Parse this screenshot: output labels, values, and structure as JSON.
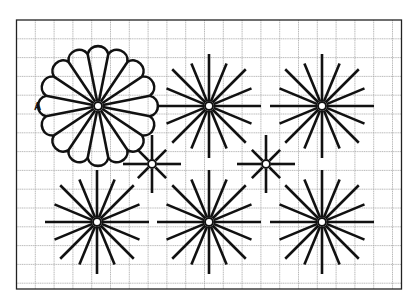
{
  "diagram": {
    "colors": {
      "background": "#ffffff",
      "grid": "#a8a8a8",
      "frame": "#222222",
      "ink": "#111111"
    },
    "frame": {
      "x": 16.5,
      "y": 20,
      "width": 385,
      "height": 269
    },
    "grid": {
      "spacing": 18.8
    },
    "label_a": {
      "text": "A",
      "x": 34,
      "y": 101
    },
    "flower": {
      "id": "A",
      "cx": 98,
      "cy": 106,
      "spokes": 16,
      "scallops": 16,
      "outer_radius": 59,
      "valley_radius": 53
    },
    "large_stars": [
      {
        "name": "star-top-middle",
        "cx": 209,
        "cy": 106,
        "spokes": 16,
        "long": 52,
        "short": 46
      },
      {
        "name": "star-top-right",
        "cx": 322,
        "cy": 106,
        "spokes": 16,
        "long": 52,
        "short": 46
      },
      {
        "name": "star-bottom-left",
        "cx": 97,
        "cy": 222,
        "spokes": 16,
        "long": 52,
        "short": 46
      },
      {
        "name": "star-bottom-middle",
        "cx": 209,
        "cy": 222,
        "spokes": 16,
        "long": 52,
        "short": 46
      },
      {
        "name": "star-bottom-right",
        "cx": 322,
        "cy": 222,
        "spokes": 16,
        "long": 52,
        "short": 46
      }
    ],
    "small_stars": [
      {
        "name": "small-star-left",
        "cx": 152,
        "cy": 164,
        "spokes": 8,
        "long": 29,
        "short": 20
      },
      {
        "name": "small-star-right",
        "cx": 266,
        "cy": 164,
        "spokes": 8,
        "long": 29,
        "short": 20
      }
    ],
    "center_hole_radius": 4
  }
}
